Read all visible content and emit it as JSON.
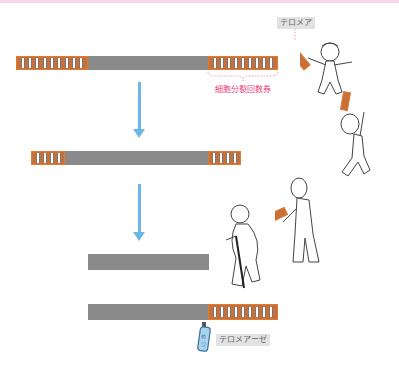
{
  "diagram": {
    "title": "",
    "labels": {
      "telomere": "テロメア",
      "cell_division_ticket": "細胞分裂回数券",
      "telomerase": "テロメアーゼ"
    },
    "colors": {
      "chromosome": "#8a8a8a",
      "telomere": "#c8703a",
      "telomere_border": "#e07a30",
      "arrow": "#6cb6ea",
      "pink_label": "#e8407a",
      "label_bg": "#e2e2e2",
      "top_strip": "#f8d6ea"
    },
    "stages": [
      {
        "name": "young",
        "left_telomere_rungs": 9,
        "right_telomere_rungs": 9,
        "figure": "child"
      },
      {
        "name": "adult",
        "left_telomere_rungs": 4,
        "right_telomere_rungs": 4,
        "figure": "adult"
      },
      {
        "name": "elderly",
        "left_telomere_rungs": 0,
        "right_telomere_rungs": 0,
        "figure": "elderly-with-cane"
      },
      {
        "name": "telomerase-restored",
        "left_telomere_rungs": 0,
        "right_telomere_rungs": 9,
        "figure": "telomerase-bottle"
      }
    ]
  }
}
